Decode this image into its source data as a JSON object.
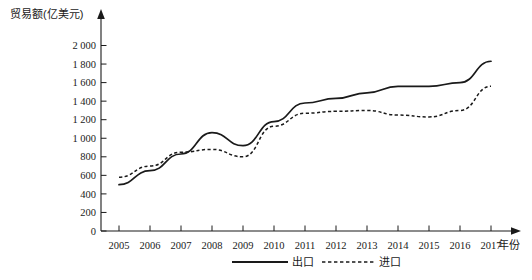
{
  "chart_data": {
    "type": "line",
    "title": "",
    "ylabel": "贸易额(亿美元)",
    "xlabel": "年份",
    "categories": [
      "2005",
      "2006",
      "2007",
      "2008",
      "2009",
      "2010",
      "2011",
      "2012",
      "2013",
      "2014",
      "2015",
      "2016",
      "2017"
    ],
    "x": [
      2005,
      2006,
      2007,
      2008,
      2009,
      2010,
      2011,
      2012,
      2013,
      2014,
      2015,
      2016,
      2017
    ],
    "series": [
      {
        "name": "出口",
        "style": "solid",
        "values": [
          500,
          650,
          830,
          1060,
          920,
          1180,
          1380,
          1430,
          1490,
          1560,
          1560,
          1600,
          1830
        ]
      },
      {
        "name": "进口",
        "style": "dashed",
        "values": [
          580,
          700,
          850,
          880,
          800,
          1130,
          1270,
          1290,
          1300,
          1250,
          1230,
          1300,
          1560
        ]
      }
    ],
    "ylim": [
      0,
      2000
    ],
    "ytick_step": 200,
    "ytick_labels": [
      "0",
      "200",
      "400",
      "600",
      "800",
      "1 000",
      "1 200",
      "1 400",
      "1 600",
      "1 800",
      "2 000"
    ],
    "xlim": [
      2005,
      2017
    ],
    "grid": false,
    "legend_position": "bottom-center",
    "legend": [
      {
        "label": "出口",
        "style": "solid"
      },
      {
        "label": "进口",
        "style": "dashed"
      }
    ],
    "colors": {
      "line": "#1a1a1a",
      "background": "#ffffff"
    }
  }
}
